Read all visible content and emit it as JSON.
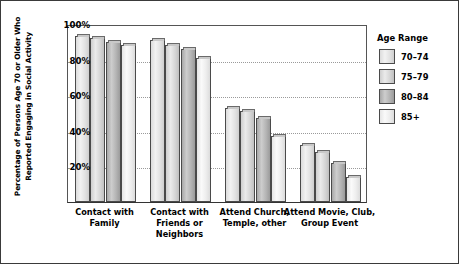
{
  "chart_data": {
    "type": "bar",
    "title": "",
    "xlabel": "",
    "ylabel": "Percentage of Persons Age 70 or Older Who Reported Engaging in Social Activity",
    "ylabel_line1": "Percentage of Persons Age 70 or Older Who",
    "ylabel_line2": "Reported Engaging in Social Activity",
    "ylim": [
      0,
      100
    ],
    "ytick_labels": [
      "100%",
      "80%",
      "60%",
      "40%",
      "20%"
    ],
    "ytick_values": [
      100,
      80,
      60,
      40,
      20
    ],
    "grid": "horizontal-dotted",
    "legend_position": "right",
    "legend_title": "Age Range",
    "categories": [
      "Contact with Family",
      "Contact with Friends or Neighbors",
      "Attend Church, Temple, other",
      "Attend Movie, Club, Group Event"
    ],
    "category_lines": [
      [
        "Contact with",
        "Family"
      ],
      [
        "Contact with",
        "Friends or",
        "Neighbors"
      ],
      [
        "Attend Church,",
        "Temple, other"
      ],
      [
        "Attend Movie, Club,",
        "Group Event"
      ]
    ],
    "series": [
      {
        "name": "70–74",
        "values": [
          93,
          91,
          53,
          32
        ]
      },
      {
        "name": "75–79",
        "values": [
          92,
          88,
          51,
          28
        ]
      },
      {
        "name": "80–84",
        "values": [
          90,
          86,
          47,
          22
        ]
      },
      {
        "name": "85+",
        "values": [
          88,
          81,
          37,
          14
        ]
      }
    ]
  },
  "legend": {
    "title": "Age Range",
    "items": [
      {
        "label": "70–74"
      },
      {
        "label": "75–79"
      },
      {
        "label": "80–84"
      },
      {
        "label": "85+"
      }
    ]
  }
}
